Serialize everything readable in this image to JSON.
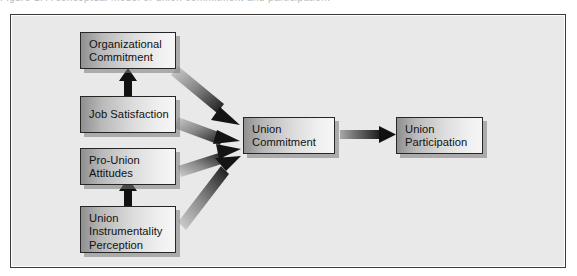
{
  "figure": {
    "caption_sliver": "Figure 1.  A conceptual model of union commitment and participation.",
    "background_color": "#e9e9e9",
    "frame_border_color": "#3a3a3a",
    "node_fill_light": "#f6f6f6",
    "node_fill_dark": "#8f8f8f",
    "arrow_color_dark": "#1a1a1a",
    "arrow_color_light": "#cfcfcf"
  },
  "nodes": [
    {
      "id": "organizational-commitment",
      "lines": [
        "Organizational",
        "Commitment"
      ],
      "x": 80,
      "y": 32,
      "w": 96,
      "h": 37
    },
    {
      "id": "job-satisfaction",
      "lines": [
        "Job Satisfaction"
      ],
      "x": 80,
      "y": 96,
      "w": 96,
      "h": 37
    },
    {
      "id": "pro-union-attitudes",
      "lines": [
        "Pro-Union",
        "Attitudes"
      ],
      "x": 80,
      "y": 148,
      "w": 96,
      "h": 37
    },
    {
      "id": "union-instrumentality-perception",
      "lines": [
        "Union",
        "Instrumentality",
        "Perception"
      ],
      "x": 80,
      "y": 206,
      "w": 96,
      "h": 47
    },
    {
      "id": "union-commitment",
      "lines": [
        "Union",
        "Commitment"
      ],
      "x": 243,
      "y": 117,
      "w": 92,
      "h": 37
    },
    {
      "id": "union-participation",
      "lines": [
        "Union",
        "Participation"
      ],
      "x": 396,
      "y": 117,
      "w": 87,
      "h": 37
    }
  ],
  "edges": [
    {
      "id": "job-satisfaction-to-organizational-commitment",
      "style": "solid-black-vertical-up"
    },
    {
      "id": "union-instrumentality-to-pro-union-attitudes",
      "style": "solid-black-vertical-up"
    },
    {
      "id": "organizational-commitment-to-union-commitment",
      "style": "gradient-diagonal"
    },
    {
      "id": "job-satisfaction-to-union-commitment",
      "style": "gradient-diagonal"
    },
    {
      "id": "pro-union-attitudes-to-union-commitment",
      "style": "gradient-diagonal"
    },
    {
      "id": "union-instrumentality-to-union-commitment",
      "style": "gradient-diagonal"
    },
    {
      "id": "union-commitment-to-union-participation",
      "style": "gradient-horizontal"
    }
  ]
}
